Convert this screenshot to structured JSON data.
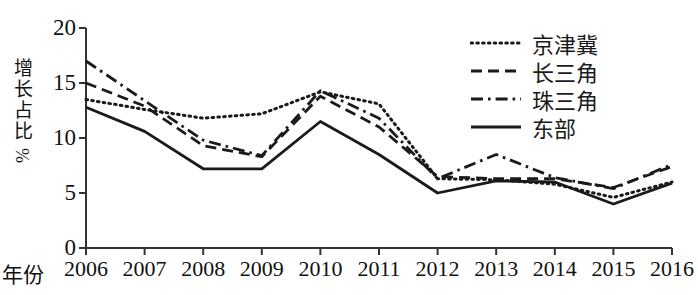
{
  "chart_data": {
    "type": "line",
    "title": "",
    "xlabel": "年份",
    "ylabel": "增长占比",
    "ylabel_unit": "%",
    "categories": [
      "2006",
      "2007",
      "2008",
      "2009",
      "2010",
      "2011",
      "2012",
      "2013",
      "2014",
      "2015",
      "2016"
    ],
    "xlim": [
      2006,
      2016
    ],
    "ylim": [
      0,
      20
    ],
    "yticks": [
      0,
      5,
      10,
      15,
      20
    ],
    "grid": false,
    "legend_position": "top-right",
    "series": [
      {
        "name": "京津冀",
        "style": "dotted",
        "values": [
          13.5,
          12.6,
          11.8,
          12.2,
          14.2,
          13.1,
          6.3,
          6.2,
          5.8,
          4.6,
          6.0
        ]
      },
      {
        "name": "长三角",
        "style": "dashed",
        "values": [
          15.0,
          12.9,
          9.3,
          8.3,
          13.8,
          11.0,
          6.5,
          6.3,
          6.3,
          5.5,
          7.4
        ]
      },
      {
        "name": "珠三角",
        "style": "dash-dot",
        "values": [
          17.0,
          13.4,
          9.8,
          8.4,
          14.3,
          11.8,
          6.3,
          8.5,
          6.4,
          5.4,
          7.6
        ]
      },
      {
        "name": "东部",
        "style": "solid",
        "values": [
          12.8,
          10.6,
          7.2,
          7.2,
          11.5,
          8.5,
          5.0,
          6.1,
          6.0,
          4.0,
          5.9
        ]
      }
    ]
  },
  "axis": {
    "y_ticks": [
      "20",
      "15",
      "10",
      "5",
      "0"
    ],
    "x_ticks": [
      "2006",
      "2007",
      "2008",
      "2009",
      "2010",
      "2011",
      "2012",
      "2013",
      "2014",
      "2015",
      "2016"
    ],
    "y_title": "增长占比",
    "y_unit": "%",
    "x_title": "年份"
  },
  "legend": {
    "items": [
      {
        "label": "京津冀",
        "style": "dotted"
      },
      {
        "label": "长三角",
        "style": "dashed"
      },
      {
        "label": "珠三角",
        "style": "dash-dot"
      },
      {
        "label": "东部",
        "style": "solid"
      }
    ]
  },
  "colors": {
    "line": "#1a1a1a",
    "axis": "#333333",
    "background": "#ffffff"
  }
}
